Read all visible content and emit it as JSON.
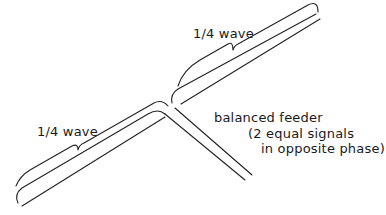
{
  "diagram": {
    "stroke_color": "#222222",
    "background": "#ffffff",
    "labels": {
      "upper_element": "1/4 wave",
      "lower_element": "1/4 wave",
      "feeder_line1": "balanced feeder",
      "feeder_line2": "(2 equal signals",
      "feeder_line3": "in opposite phase)"
    },
    "elements": [
      {
        "name": "upper-quarter-wave-element",
        "label_key": "upper_element"
      },
      {
        "name": "lower-quarter-wave-element",
        "label_key": "lower_element"
      },
      {
        "name": "balanced-feeder",
        "label_key": "feeder_line1"
      }
    ]
  }
}
